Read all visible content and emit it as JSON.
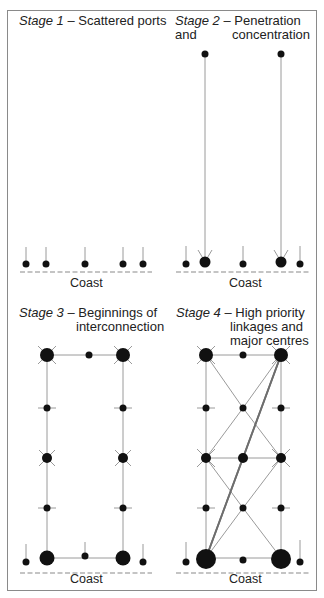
{
  "figure": {
    "panels": [
      {
        "id": "stage1",
        "stage": "Stage 1",
        "dash": "–",
        "title_lines": [
          "Scattered ports"
        ],
        "coast_label": "Coast"
      },
      {
        "id": "stage2",
        "stage": "Stage 2",
        "dash": "–",
        "title_lines": [
          "Penetration and",
          "concentration"
        ],
        "coast_label": "Coast"
      },
      {
        "id": "stage3",
        "stage": "Stage 3",
        "dash": "–",
        "title_lines": [
          "Beginnings of",
          "interconnection"
        ],
        "coast_label": "Coast"
      },
      {
        "id": "stage4",
        "stage": "Stage 4",
        "dash": "–",
        "title_lines": [
          "High priority",
          "linkages and",
          "major centres"
        ],
        "coast_label": "Coast"
      }
    ],
    "colors": {
      "node": "#111111",
      "link": "#9a9a9a",
      "priority_link": "#6e6e6e",
      "coast": "#8a8a8a",
      "frame": "#8a8a8a"
    }
  }
}
